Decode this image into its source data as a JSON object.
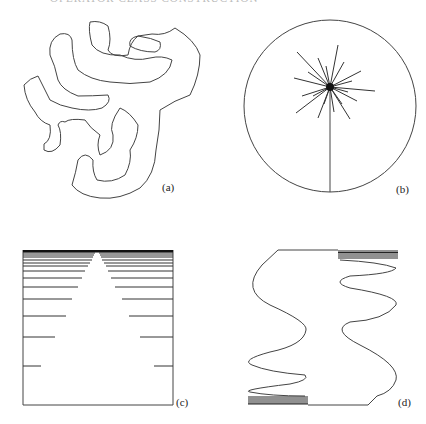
{
  "header": {
    "text": "OPERATOR CLASS CONSTRUCTION"
  },
  "panels": [
    {
      "id": "a",
      "label": "(a)",
      "description": "irregular closed contour shape"
    },
    {
      "id": "b",
      "label": "(b)",
      "description": "circle with radial star and vertical stem"
    },
    {
      "id": "c",
      "label": "(c)",
      "description": "square with horizontal lines converging to triangle"
    },
    {
      "id": "d",
      "label": "(d)",
      "description": "two oscillating curves with compressed oscillations"
    }
  ]
}
